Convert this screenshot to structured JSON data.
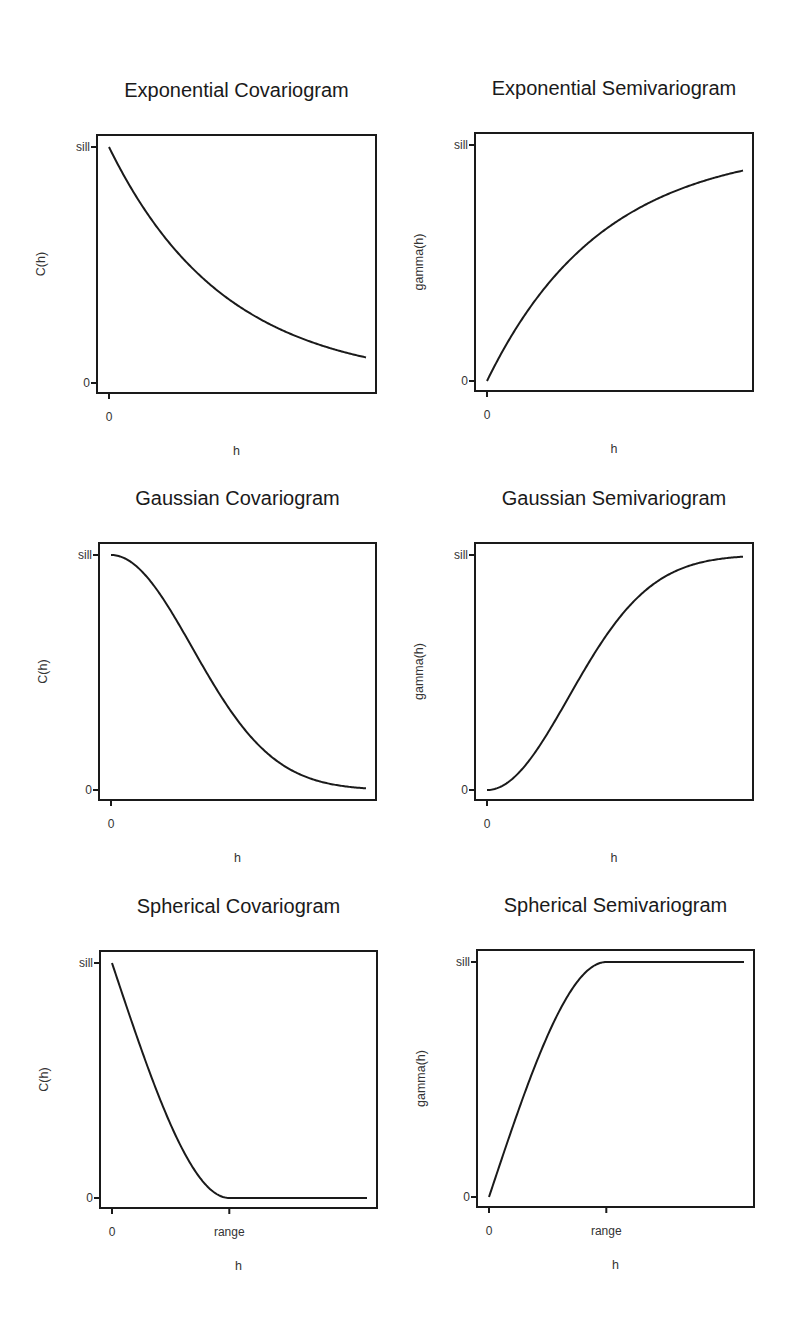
{
  "chart_data": [
    {
      "id": "exp-cov",
      "type": "line",
      "title": "Exponential Covariogram",
      "xlabel": "h",
      "ylabel": "C(h)",
      "xticks": [
        {
          "pos": 0,
          "label": "0"
        }
      ],
      "yticks": [
        {
          "pos": 0,
          "label": "0"
        },
        {
          "pos": 1,
          "label": "sill"
        }
      ],
      "model": "exponential",
      "kind": "covariogram",
      "xmax": 1.0,
      "range_param": 0.45,
      "x": [
        0,
        0.1,
        0.2,
        0.3,
        0.4,
        0.5,
        0.6,
        0.7,
        0.8,
        0.9,
        1.0
      ],
      "values": [
        1.0,
        0.8,
        0.64,
        0.51,
        0.41,
        0.33,
        0.26,
        0.21,
        0.17,
        0.14,
        0.11
      ],
      "box": {
        "x": 97,
        "y": 135,
        "w": 279,
        "h": 258
      }
    },
    {
      "id": "exp-semi",
      "type": "line",
      "title": "Exponential Semivariogram",
      "xlabel": "h",
      "ylabel": "gamma(h)",
      "xticks": [
        {
          "pos": 0,
          "label": "0"
        }
      ],
      "yticks": [
        {
          "pos": 0,
          "label": "0"
        },
        {
          "pos": 1,
          "label": "sill"
        }
      ],
      "model": "exponential",
      "kind": "semivariogram",
      "xmax": 1.0,
      "range_param": 0.45,
      "x": [
        0,
        0.1,
        0.2,
        0.3,
        0.4,
        0.5,
        0.6,
        0.7,
        0.8,
        0.9,
        1.0
      ],
      "values": [
        0.0,
        0.2,
        0.36,
        0.49,
        0.59,
        0.67,
        0.74,
        0.79,
        0.83,
        0.86,
        0.89
      ],
      "box": {
        "x": 475,
        "y": 133,
        "w": 278,
        "h": 258
      }
    },
    {
      "id": "gau-cov",
      "type": "line",
      "title": "Gaussian Covariogram",
      "xlabel": "h",
      "ylabel": "C(h)",
      "xticks": [
        {
          "pos": 0,
          "label": "0"
        }
      ],
      "yticks": [
        {
          "pos": 0,
          "label": "0"
        },
        {
          "pos": 1,
          "label": "sill"
        }
      ],
      "model": "gaussian",
      "kind": "covariogram",
      "xmax": 1.0,
      "range_param": 0.45,
      "x": [
        0,
        0.1,
        0.2,
        0.3,
        0.4,
        0.5,
        0.6,
        0.7,
        0.8,
        0.9,
        1.0
      ],
      "values": [
        1.0,
        0.95,
        0.82,
        0.64,
        0.45,
        0.29,
        0.17,
        0.09,
        0.04,
        0.02,
        0.01
      ],
      "box": {
        "x": 99,
        "y": 543,
        "w": 277,
        "h": 257
      }
    },
    {
      "id": "gau-semi",
      "type": "line",
      "title": "Gaussian Semivariogram",
      "xlabel": "h",
      "ylabel": "gamma(h)",
      "xticks": [
        {
          "pos": 0,
          "label": "0"
        }
      ],
      "yticks": [
        {
          "pos": 0,
          "label": "0"
        },
        {
          "pos": 1,
          "label": "sill"
        }
      ],
      "model": "gaussian",
      "kind": "semivariogram",
      "xmax": 1.0,
      "range_param": 0.45,
      "x": [
        0,
        0.1,
        0.2,
        0.3,
        0.4,
        0.5,
        0.6,
        0.7,
        0.8,
        0.9,
        1.0
      ],
      "values": [
        0.0,
        0.05,
        0.18,
        0.36,
        0.55,
        0.71,
        0.83,
        0.91,
        0.96,
        0.98,
        0.99
      ],
      "box": {
        "x": 475,
        "y": 543,
        "w": 278,
        "h": 257
      }
    },
    {
      "id": "sph-cov",
      "type": "line",
      "title": "Spherical Covariogram",
      "xlabel": "h",
      "ylabel": "C(h)",
      "xticks": [
        {
          "pos": 0,
          "label": "0"
        },
        {
          "pos": 0.46,
          "label": "range"
        }
      ],
      "yticks": [
        {
          "pos": 0,
          "label": "0"
        },
        {
          "pos": 1,
          "label": "sill"
        }
      ],
      "model": "spherical",
      "kind": "covariogram",
      "xmax": 1.0,
      "range_param": 0.46,
      "x": [
        0,
        0.1,
        0.2,
        0.3,
        0.4,
        0.46,
        0.6,
        0.8,
        1.0
      ],
      "values": [
        1.0,
        0.68,
        0.37,
        0.13,
        0.01,
        0.0,
        0.0,
        0.0,
        0.0
      ],
      "box": {
        "x": 100,
        "y": 951,
        "w": 277,
        "h": 257
      }
    },
    {
      "id": "sph-semi",
      "type": "line",
      "title": "Spherical Semivariogram",
      "xlabel": "h",
      "ylabel": "gamma(h)",
      "xticks": [
        {
          "pos": 0,
          "label": "0"
        },
        {
          "pos": 0.46,
          "label": "range"
        }
      ],
      "yticks": [
        {
          "pos": 0,
          "label": "0"
        },
        {
          "pos": 1,
          "label": "sill"
        }
      ],
      "model": "spherical",
      "kind": "semivariogram",
      "xmax": 1.0,
      "range_param": 0.46,
      "x": [
        0,
        0.1,
        0.2,
        0.3,
        0.4,
        0.46,
        0.6,
        0.8,
        1.0
      ],
      "values": [
        0.0,
        0.32,
        0.63,
        0.87,
        0.99,
        1.0,
        1.0,
        1.0,
        1.0
      ],
      "box": {
        "x": 477,
        "y": 950,
        "w": 277,
        "h": 257
      }
    }
  ]
}
